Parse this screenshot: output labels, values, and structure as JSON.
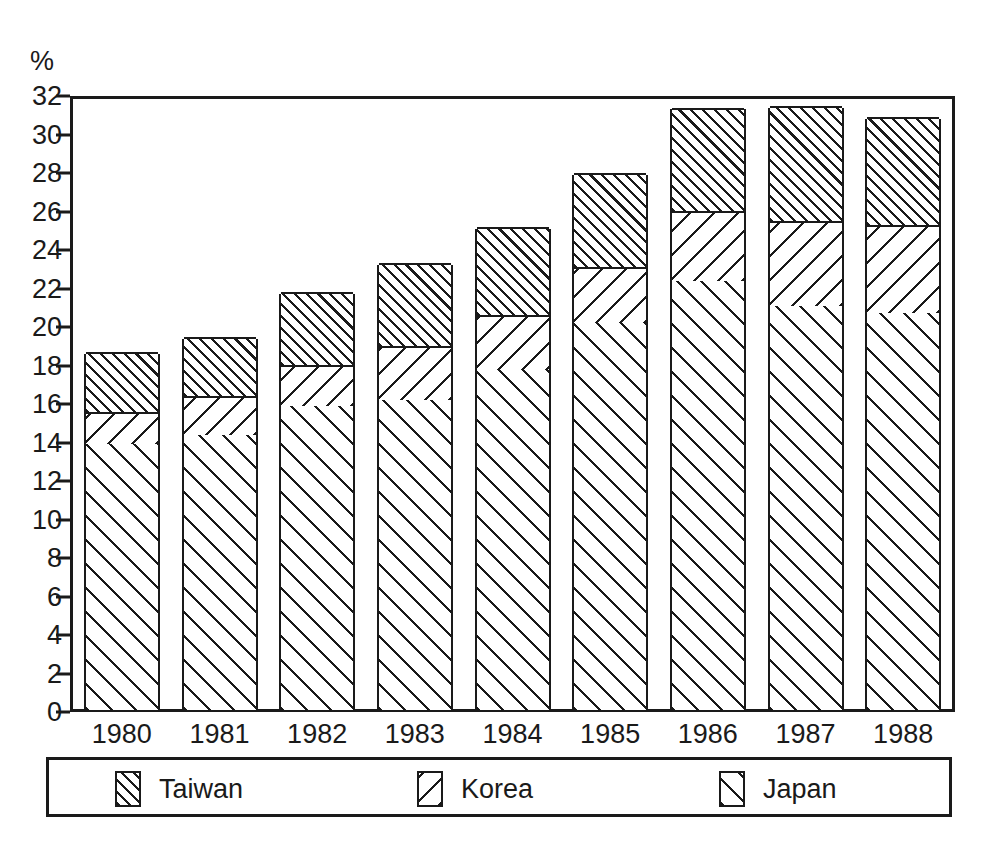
{
  "chart_data": {
    "type": "bar",
    "title": "",
    "subtitle": "",
    "xlabel": "",
    "ylabel": "%",
    "y_unit_label": "%",
    "stacked": true,
    "grid": false,
    "legend_position": "bottom",
    "ylim": [
      0,
      32
    ],
    "ytick_step": 2,
    "yticks": [
      0,
      2,
      4,
      6,
      8,
      10,
      12,
      14,
      16,
      18,
      20,
      22,
      24,
      26,
      28,
      30,
      32
    ],
    "ytick_labels": [
      "0",
      "2",
      "4",
      "6",
      "8",
      "10",
      "12",
      "14",
      "16",
      "18",
      "20",
      "22",
      "24",
      "26",
      "28",
      "30",
      "32"
    ],
    "categories": [
      "1980",
      "1981",
      "1982",
      "1983",
      "1984",
      "1985",
      "1986",
      "1987",
      "1988"
    ],
    "series": [
      {
        "name": "Japan",
        "pattern": "diagonal-hatch-forward-sparse",
        "values": [
          13.8,
          14.3,
          15.8,
          16.1,
          17.7,
          20.1,
          22.3,
          21.0,
          20.6
        ]
      },
      {
        "name": "Korea",
        "pattern": "diagonal-hatch-backward-sparse",
        "values": [
          1.7,
          2.0,
          2.1,
          2.8,
          2.8,
          2.9,
          3.6,
          4.4,
          4.6
        ]
      },
      {
        "name": "Taiwan",
        "pattern": "diagonal-hatch-forward-dense",
        "values": [
          3.1,
          3.1,
          3.8,
          4.3,
          4.6,
          4.9,
          5.4,
          6.0,
          5.6
        ]
      }
    ],
    "cumulative_tops": {
      "japan": [
        13.8,
        14.3,
        15.8,
        16.1,
        17.7,
        20.1,
        22.3,
        21.0,
        20.6
      ],
      "korea": [
        15.5,
        16.3,
        17.9,
        18.9,
        20.5,
        23.0,
        25.9,
        25.4,
        25.2
      ],
      "taiwan": [
        18.6,
        19.4,
        21.7,
        23.2,
        25.1,
        27.9,
        31.3,
        31.4,
        30.8
      ]
    },
    "totals": [
      18.6,
      19.4,
      21.7,
      23.2,
      25.1,
      27.9,
      31.3,
      31.4,
      30.8
    ]
  },
  "legend": {
    "entries": [
      {
        "label": "Taiwan",
        "swatch": "taiwan-hatch-swatch"
      },
      {
        "label": "Korea",
        "swatch": "korea-hatch-swatch"
      },
      {
        "label": "Japan",
        "swatch": "japan-hatch-swatch"
      }
    ]
  },
  "colors": {
    "ink": "#1a1a1a",
    "background": "#ffffff"
  }
}
